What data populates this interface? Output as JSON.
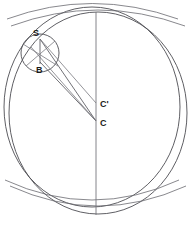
{
  "figure": {
    "title": "",
    "kind": "geometric-construction",
    "background_color": "#ffffff",
    "stroke_color": "#4d4d52",
    "label_color": "#1b1b1b",
    "canvas": {
      "width": 195,
      "height": 228
    }
  },
  "labels": {
    "s": "S",
    "b": "B",
    "c": "C",
    "c_prime": "C'"
  },
  "points": {
    "S": {
      "x": 40,
      "y": 39,
      "label": "S",
      "label_x": 34,
      "label_y": 35
    },
    "B": {
      "x": 40,
      "y": 62,
      "label": "B",
      "label_x": 36,
      "label_y": 72
    },
    "C": {
      "x": 96,
      "y": 121,
      "label": "C",
      "label_x": 100,
      "label_y": 126
    },
    "Cp": {
      "x": 96,
      "y": 102,
      "label": "C'",
      "label_x": 100,
      "label_y": 106
    }
  },
  "circles": {
    "outer_large": {
      "cx": 98,
      "cy": 113,
      "rx": 90,
      "ry": 101,
      "name": "outer-sphere-circle"
    },
    "inner_large": {
      "cx": 93,
      "cy": 108,
      "rx": 90,
      "ry": 101,
      "name": "inner-sphere-circle"
    },
    "small": {
      "cx": 40,
      "cy": 53,
      "r": 19,
      "name": "small-circle-at-s"
    }
  },
  "arcs": {
    "upper_band": {
      "name": "upper-latitude-arc"
    },
    "lower_band": {
      "name": "lower-latitude-arc"
    },
    "upper_band_2": {
      "name": "upper-latitude-arc-secondary"
    },
    "lower_band_2": {
      "name": "lower-latitude-arc-secondary"
    }
  },
  "lines": {
    "vertical_axis": {
      "x1": 96,
      "y1": 12,
      "x2": 96,
      "y2": 215,
      "name": "vertical-axis"
    },
    "ray_s_to_c": {
      "x1": 40,
      "y1": 39,
      "x2": 96,
      "y2": 121,
      "name": "ray-s-to-c"
    },
    "ray_b_to_c": {
      "x1": 40,
      "y1": 62,
      "x2": 96,
      "y2": 121,
      "name": "ray-b-to-c"
    },
    "ray_s_to_cp": {
      "x1": 40,
      "y1": 39,
      "x2": 96,
      "y2": 103,
      "name": "ray-s-to-c-prime"
    },
    "seg_s_to_b": {
      "x1": 40,
      "y1": 39,
      "x2": 40,
      "y2": 64,
      "name": "segment-s-to-b"
    }
  }
}
